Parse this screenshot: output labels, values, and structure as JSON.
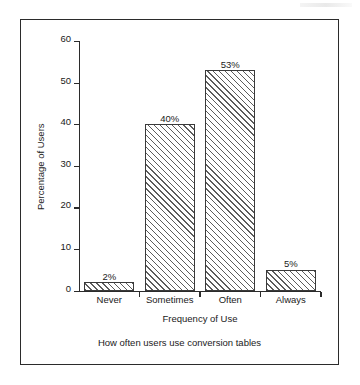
{
  "chart_data": {
    "type": "bar",
    "title": "",
    "caption": "How often users use conversion tables",
    "xlabel": "Frequency of Use",
    "ylabel": "Percentage of Users",
    "categories": [
      "Never",
      "Sometimes",
      "Often",
      "Always"
    ],
    "values": [
      2,
      40,
      53,
      5
    ],
    "value_labels": [
      "2%",
      "40%",
      "53%",
      "5%"
    ],
    "ylim": [
      0,
      60
    ],
    "yticks": [
      0,
      10,
      20,
      30,
      40,
      50,
      60
    ],
    "ytick_labels": [
      "0",
      "10",
      "20",
      "30",
      "40",
      "50",
      "60"
    ],
    "grid": false,
    "legend": null,
    "bar_fill": "diagonal-hatch",
    "colors": {
      "axis": "#2b2b2b",
      "bar_edge": "#3a3a3a",
      "hatch": "#5c5c5c",
      "bar_face": "#ffffff",
      "text": "#1a1a1a",
      "frame": "#2b2b2b",
      "background": "#ffffff"
    }
  }
}
